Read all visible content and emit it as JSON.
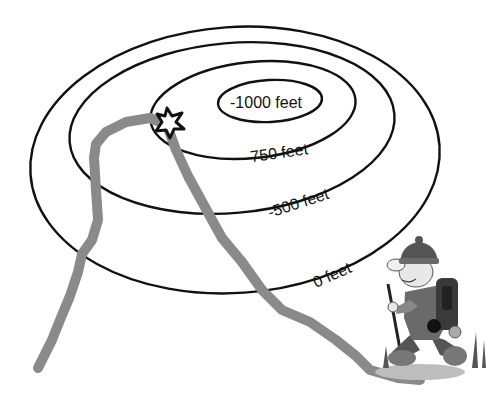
{
  "diagram": {
    "type": "topographic-contour-map",
    "contours": [
      {
        "label": "0 feet",
        "elevation": 0
      },
      {
        "label": "-500 feet",
        "elevation": -500
      },
      {
        "label": "-750 feet",
        "elevation": -750
      },
      {
        "label": "-1000 feet",
        "elevation": -1000
      }
    ],
    "markers": {
      "star": "star-icon",
      "hiker": "hiker-illustration",
      "path": "hiking-path"
    },
    "colors": {
      "contour": "#111111",
      "path": "#8a8a8a",
      "star_fill": "#ffffff",
      "star_stroke": "#111111",
      "background": "#ffffff"
    }
  }
}
